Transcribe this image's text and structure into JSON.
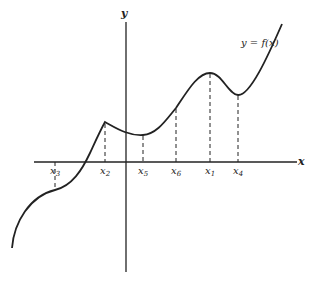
{
  "figure": {
    "type": "function-graph",
    "curve_label": "y = f(x)",
    "x_axis_label": "x",
    "y_axis_label": "y",
    "points": [
      {
        "name": "x3",
        "label": "x",
        "sub": "3",
        "px": 55
      },
      {
        "name": "x2",
        "label": "x",
        "sub": "2",
        "px": 105
      },
      {
        "name": "x5",
        "label": "x",
        "sub": "5",
        "px": 143
      },
      {
        "name": "x6",
        "label": "x",
        "sub": "6",
        "px": 176
      },
      {
        "name": "x1",
        "label": "x",
        "sub": "1",
        "px": 210
      },
      {
        "name": "x4",
        "label": "x",
        "sub": "4",
        "px": 238
      }
    ],
    "colors": {
      "ink": "#222222",
      "background": "#ffffff"
    }
  }
}
